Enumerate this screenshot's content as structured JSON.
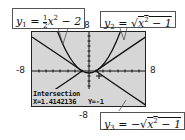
{
  "graph": {
    "window": {
      "xmin": -8,
      "xmax": 8,
      "ymin": -8,
      "ymax": 8
    },
    "axis_labels": {
      "top": "8",
      "left": "-8",
      "right": "8",
      "bottom": "-8"
    },
    "background_color": "#d6d6d6",
    "curve_color": "#222222"
  },
  "equations": [
    {
      "id": "y1",
      "name": "y",
      "sub": "1",
      "display": "y1 = 1/2 x^2 - 2",
      "prefix": " = ",
      "frac_num": "1",
      "frac_den": "2",
      "body": "x",
      "sup": "2",
      "tail": " − 2"
    },
    {
      "id": "y2",
      "name": "y",
      "sub": "2",
      "display": "y2 = sqrt(x^2 - 1)",
      "prefix": " = √",
      "body": "x",
      "sup": "2",
      "tail": " − 1"
    },
    {
      "id": "y3",
      "name": "y",
      "sub": "3",
      "display": "y3 = -sqrt(x^2 - 1)",
      "prefix": " = −√",
      "body": "x",
      "sup": "2",
      "tail": " − 1"
    }
  ],
  "status": {
    "title": "Intersection",
    "x_label": "X=1.4142136",
    "y_label": "Y=-1"
  }
}
